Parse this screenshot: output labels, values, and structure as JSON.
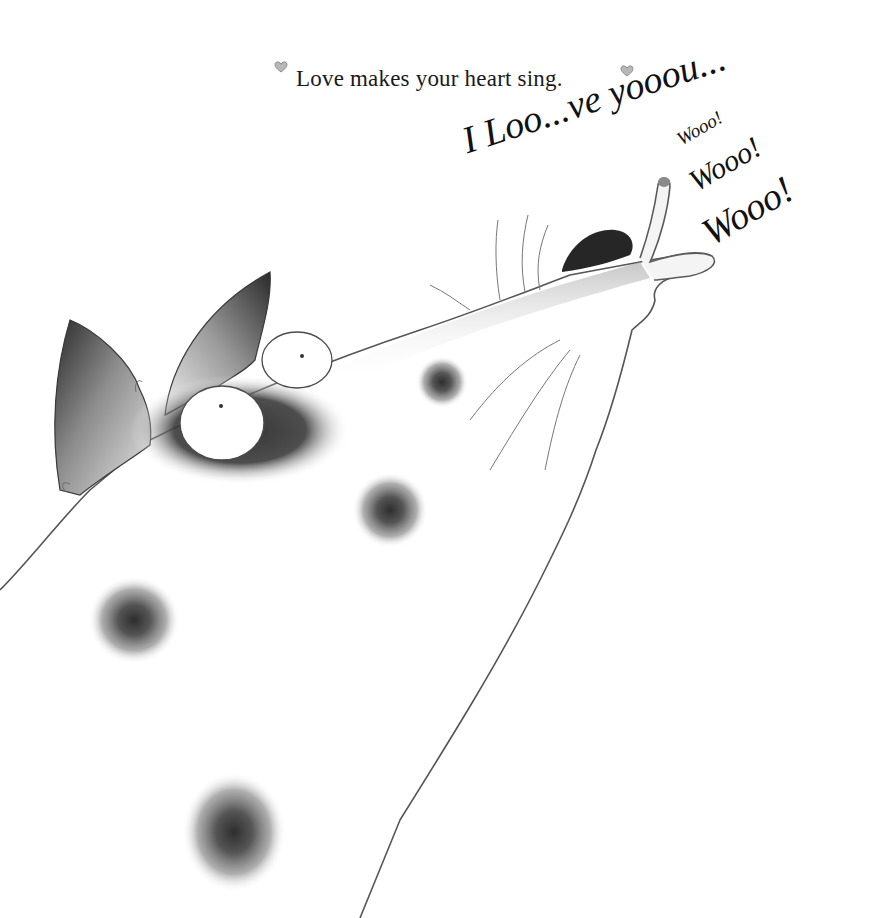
{
  "page": {
    "caption": "Love makes your heart sing.",
    "decorations": {
      "left_icon": "heart-icon",
      "right_icon": "heart-icon"
    }
  },
  "speech": {
    "line1": "I Loo...ve yooou...",
    "woo_small": "Wooo!",
    "woo_medium": "Wooo!",
    "woo_large": "Wooo!"
  },
  "illustration": {
    "subject": "spotted dog howling upward",
    "colors": {
      "ink": "#1a1a1a",
      "wash_dark": "#3a3a3a",
      "wash_mid": "#7a7a7a",
      "wash_light": "#c8c8c8",
      "paper": "#ffffff"
    }
  }
}
